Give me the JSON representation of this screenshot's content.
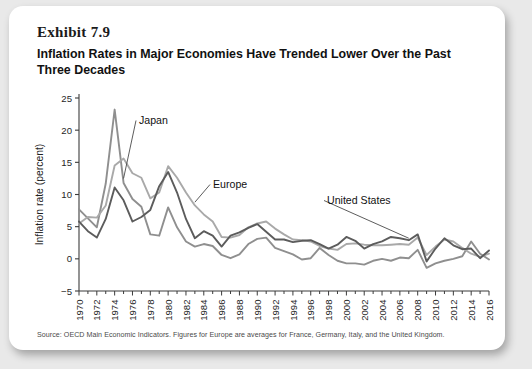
{
  "card": {
    "exhibit_label": "Exhibit 7.9",
    "title": "Inflation Rates in Major Economies Have Trended Lower Over the Past Three Decades",
    "source_note": "Source: OECD Main Economic Indicators. Figures for Europe are averages for France, Germany, Italy, and the United Kingdom."
  },
  "colors": {
    "japan": "#8f8f8f",
    "europe": "#a9a9a9",
    "united_states": "#5c5c5c",
    "axis": "#3b3b3b",
    "card_background": "#ffffff",
    "page_background": "#e9e9e9",
    "label_text": "#1b1b1b"
  },
  "chart_data": {
    "type": "line",
    "title": "Inflation Rates in Major Economies Have Trended Lower Over the Past Three Decades",
    "xlabel": "",
    "ylabel": "Inflation rate (percent)",
    "ylim": [
      -5,
      25
    ],
    "ytick_values": [
      -5,
      0,
      5,
      10,
      15,
      20,
      25
    ],
    "ytick_labels": [
      "−5",
      "0",
      "5",
      "10",
      "15",
      "20",
      "25"
    ],
    "xlim": [
      1970,
      2016
    ],
    "xtick_labels": [
      "1970",
      "1972",
      "1974",
      "1976",
      "1978",
      "1980",
      "1982",
      "1984",
      "1986",
      "1988",
      "1990",
      "1992",
      "1994",
      "1996",
      "1998",
      "2000",
      "2002",
      "2004",
      "2006",
      "2008",
      "2010",
      "2012",
      "2014",
      "2016"
    ],
    "xtick_step": 2,
    "minor_tick_step": 1,
    "grid": false,
    "legend": "inline-annotations",
    "x": [
      1970,
      1971,
      1972,
      1973,
      1974,
      1975,
      1976,
      1977,
      1978,
      1979,
      1980,
      1981,
      1982,
      1983,
      1984,
      1985,
      1986,
      1987,
      1988,
      1989,
      1990,
      1991,
      1992,
      1993,
      1994,
      1995,
      1996,
      1997,
      1998,
      1999,
      2000,
      2001,
      2002,
      2003,
      2004,
      2005,
      2006,
      2007,
      2008,
      2009,
      2010,
      2011,
      2012,
      2013,
      2014,
      2015,
      2016
    ],
    "series": [
      {
        "name": "Japan",
        "color": "#8f8f8f",
        "annotation": "Japan",
        "values": [
          7.7,
          6.3,
          4.9,
          11.7,
          23.2,
          11.8,
          9.3,
          8.1,
          3.8,
          3.6,
          8.0,
          4.9,
          2.7,
          1.9,
          2.3,
          2.0,
          0.6,
          0.1,
          0.7,
          2.3,
          3.1,
          3.3,
          1.7,
          1.2,
          0.7,
          -0.1,
          0.1,
          1.7,
          0.6,
          -0.3,
          -0.7,
          -0.7,
          -0.9,
          -0.3,
          0.0,
          -0.3,
          0.2,
          0.1,
          1.4,
          -1.4,
          -0.7,
          -0.3,
          0.0,
          0.4,
          2.7,
          0.8,
          -0.1
        ]
      },
      {
        "name": "Europe",
        "color": "#a9a9a9",
        "annotation": "Europe",
        "values": [
          5.5,
          6.5,
          6.4,
          8.3,
          14.5,
          15.6,
          13.3,
          12.6,
          9.4,
          10.3,
          14.4,
          12.6,
          10.3,
          8.3,
          6.9,
          5.8,
          3.4,
          3.3,
          3.7,
          4.9,
          5.5,
          5.8,
          4.7,
          3.8,
          3.0,
          2.9,
          2.7,
          2.0,
          1.6,
          1.4,
          2.3,
          2.4,
          2.2,
          2.1,
          2.1,
          2.2,
          2.3,
          2.2,
          3.3,
          0.6,
          1.9,
          3.0,
          2.7,
          1.7,
          0.8,
          0.3,
          0.8
        ]
      },
      {
        "name": "United States",
        "color": "#5c5c5c",
        "annotation": "United States",
        "values": [
          5.8,
          4.3,
          3.3,
          6.2,
          11.1,
          9.1,
          5.8,
          6.5,
          7.6,
          11.3,
          13.5,
          10.3,
          6.2,
          3.2,
          4.3,
          3.6,
          1.9,
          3.6,
          4.1,
          4.8,
          5.4,
          4.2,
          3.0,
          3.0,
          2.6,
          2.8,
          2.9,
          2.3,
          1.6,
          2.2,
          3.4,
          2.8,
          1.6,
          2.3,
          2.7,
          3.4,
          3.2,
          2.9,
          3.8,
          -0.4,
          1.6,
          3.2,
          2.1,
          1.5,
          1.6,
          0.1,
          1.3
        ]
      }
    ],
    "annotations": [
      {
        "text": "Japan",
        "x_label": 1974,
        "target_year": 1975
      },
      {
        "text": "Europe",
        "x_label": 1986,
        "target_year": 1983
      },
      {
        "text": "United States",
        "x_label": 2003,
        "target_year": 2007
      }
    ]
  }
}
